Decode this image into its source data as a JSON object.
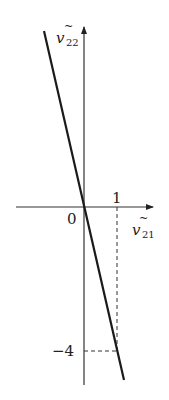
{
  "diagram": {
    "axes": {
      "x_label_base": "v",
      "x_label_sub": "21",
      "y_label_base": "v",
      "y_label_sub": "22",
      "origin_label": "0",
      "x_tick_label": "1",
      "y_tick_label": "−4"
    },
    "line": {
      "slope": -4,
      "description": "line through origin with slope -4"
    },
    "guides": {
      "from_point": [
        1,
        -4
      ],
      "style": "dashed"
    },
    "colors": {
      "stroke": "#1a1a1a",
      "axis": "#333333",
      "text": "#222222"
    }
  }
}
